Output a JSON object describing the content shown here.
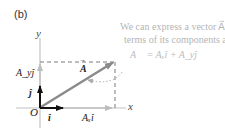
{
  "panel_label": "(b)",
  "axes": {
    "x_label": "x",
    "y_label": "y",
    "origin_label": "O"
  },
  "vectors": {
    "A_label": "A",
    "A_arrow": "→",
    "i_hat_label": "î",
    "j_hat_label": "ĵ",
    "Ax_label": "Aₓî",
    "Ay_label": "A_yĵ"
  },
  "annotation": {
    "line1": "We can express a vector A⃗ in",
    "line2": "terms of its components as",
    "equation": "A⃗ = Aₓî + A_yĵ"
  },
  "colors": {
    "axis": "#b8b8b8",
    "vector_A": "#8a8a8a",
    "unit_vector": "#111111",
    "component": "#bdbdbd",
    "dashed": "#777777",
    "note_text": "#b5b5b5"
  }
}
